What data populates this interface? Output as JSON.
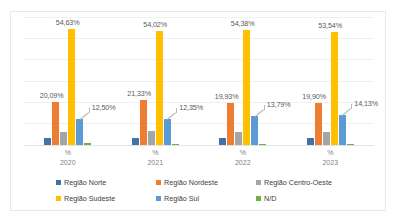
{
  "chart_data": {
    "type": "bar",
    "title": "",
    "xlabel": "",
    "ylabel": "",
    "ylim": [
      0,
      60
    ],
    "grid": true,
    "legend_position": "bottom",
    "categories": [
      "2020",
      "2021",
      "2022",
      "2023"
    ],
    "category_unit": "%",
    "series": [
      {
        "name": "Região Norte",
        "color": "#4472a8",
        "values": [
          3.1,
          3.3,
          3.15,
          3.45
        ],
        "labels": [
          "",
          "",
          "",
          ""
        ]
      },
      {
        "name": "Região Nordeste",
        "color": "#ed7d31",
        "values": [
          20.09,
          21.33,
          19.93,
          19.9
        ],
        "labels": [
          "20,09%",
          "21,33%",
          "19,93%",
          "19,90%"
        ]
      },
      {
        "name": "Região Centro-Oeste",
        "color": "#a5a5a5",
        "values": [
          6.2,
          6.4,
          6.3,
          6.35
        ],
        "labels": [
          "",
          "",
          "",
          ""
        ]
      },
      {
        "name": "Região Sudeste",
        "color": "#ffc000",
        "values": [
          54.63,
          54.02,
          54.38,
          53.54
        ],
        "labels": [
          "54,63%",
          "54,02%",
          "54,38%",
          "53,54%"
        ]
      },
      {
        "name": "Região Sul",
        "color": "#5b9bd5",
        "values": [
          12.5,
          12.35,
          13.79,
          14.13
        ],
        "labels": [
          "12,50%",
          "12,35%",
          "13,79%",
          "14,13%"
        ]
      },
      {
        "name": "N/D",
        "color": "#70ad47",
        "values": [
          0.8,
          0.45,
          0.5,
          0.35
        ],
        "labels": [
          "",
          "",
          "",
          ""
        ]
      }
    ]
  }
}
